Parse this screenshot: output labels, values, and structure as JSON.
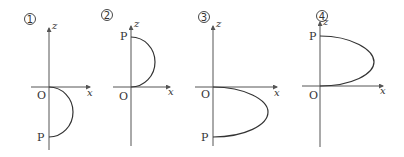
{
  "figure": {
    "axis_labels": {
      "x": "x",
      "z": "z"
    },
    "point_labels": {
      "origin": "O",
      "point": "P"
    },
    "panels": [
      {
        "number": "1",
        "curve": "semicircle",
        "P_position": "below O on negative z-axis",
        "bulge": "+x"
      },
      {
        "number": "2",
        "curve": "semicircle",
        "P_position": "above O on positive z-axis",
        "bulge": "+x"
      },
      {
        "number": "3",
        "curve": "parabola-like (wider)",
        "P_position": "below O on negative z-axis",
        "bulge": "+x"
      },
      {
        "number": "4",
        "curve": "parabola-like (wider)",
        "P_position": "above O on positive z-axis",
        "bulge": "+x"
      }
    ]
  }
}
